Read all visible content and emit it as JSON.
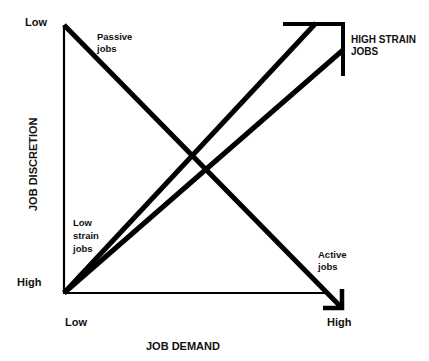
{
  "diagram": {
    "y_axis": {
      "title": "JOB DISCRETION",
      "top_label": "Low",
      "bottom_label": "High"
    },
    "x_axis": {
      "title": "JOB DEMAND",
      "left_label": "Low",
      "right_label": "High"
    },
    "regions": {
      "passive": [
        "Passive",
        "jobs"
      ],
      "high_strain": [
        "HIGH STRAIN",
        "JOBS"
      ],
      "low_strain": [
        "Low",
        "strain",
        "jobs"
      ],
      "active": [
        "Active",
        "jobs"
      ]
    },
    "colors": {
      "line": "#000000",
      "background": "#ffffff",
      "text": "#111111"
    }
  }
}
